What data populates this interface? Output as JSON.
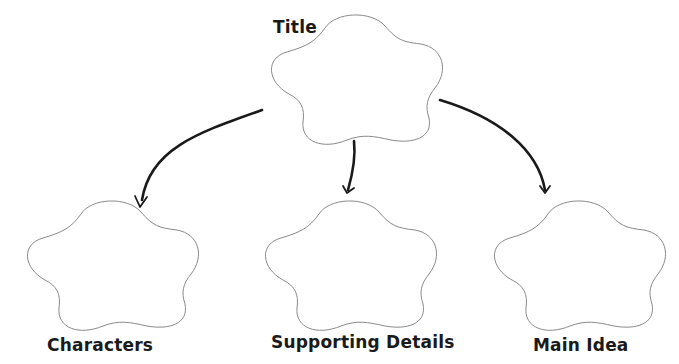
{
  "diagram": {
    "type": "graphic-organizer",
    "colors": {
      "background": "#ffffff",
      "cloud_stroke": "#8a8a8a",
      "arrow": "#1a1a1a",
      "label_text": "#1a1a1a"
    },
    "nodes": [
      {
        "id": "title",
        "label": "Title",
        "shape": "cloud"
      },
      {
        "id": "characters",
        "label": "Characters",
        "shape": "cloud"
      },
      {
        "id": "supporting_details",
        "label": "Supporting Details",
        "shape": "cloud"
      },
      {
        "id": "main_idea",
        "label": "Main Idea",
        "shape": "cloud"
      }
    ],
    "edges": [
      {
        "from": "title",
        "to": "characters"
      },
      {
        "from": "title",
        "to": "supporting_details"
      },
      {
        "from": "title",
        "to": "main_idea"
      }
    ]
  }
}
